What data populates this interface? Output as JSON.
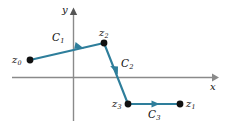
{
  "figure": {
    "name": "contour-path-complex-plane",
    "background_color": "#ffffff",
    "axes": {
      "x_label": "x",
      "y_label": "y",
      "axis_color": "#808080",
      "x_axis": {
        "y": 77,
        "x_start": 12,
        "x_end": 216
      },
      "y_axis": {
        "x": 73.5,
        "y_start": 10,
        "y_end": 121
      }
    },
    "curve_color": "#2E7E9B",
    "point_color": "#111111",
    "points": [
      {
        "id": "z0",
        "label": "z",
        "sub": "0",
        "x": 30,
        "y": 60,
        "label_x": 12,
        "label_y": 55
      },
      {
        "id": "z2",
        "label": "z",
        "sub": "2",
        "x": 104,
        "y": 43,
        "label_x": 99,
        "label_y": 28
      },
      {
        "id": "z3",
        "label": "z",
        "sub": "3",
        "x": 128,
        "y": 104,
        "label_x": 112,
        "label_y": 99
      },
      {
        "id": "z1",
        "label": "z",
        "sub": "1",
        "x": 180,
        "y": 104,
        "label_x": 186,
        "label_y": 99
      }
    ],
    "segments": [
      {
        "id": "C1",
        "label": "C",
        "sub": "1",
        "from": "z0",
        "to": "z2",
        "label_x": 52,
        "label_y": 33,
        "arrow_t": 0.66
      },
      {
        "id": "C2",
        "label": "C",
        "sub": "2",
        "from": "z2",
        "to": "z3",
        "label_x": 121,
        "label_y": 59,
        "arrow_t": 0.5
      },
      {
        "id": "C3",
        "label": "C",
        "sub": "3",
        "from": "z3",
        "to": "z1",
        "label_x": 148,
        "label_y": 110,
        "arrow_t": 0.52
      }
    ]
  }
}
